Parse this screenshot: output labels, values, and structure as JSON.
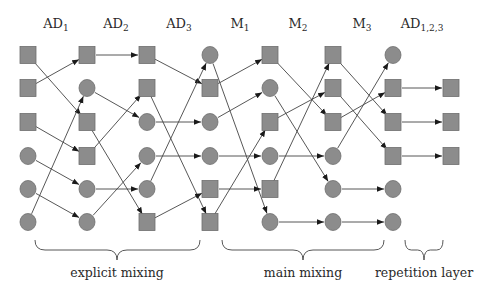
{
  "columns": [
    {
      "label": "AD",
      "sub": "1",
      "x": 28,
      "label_x": 56,
      "nodes": [
        "square",
        "square",
        "square",
        "circle",
        "circle",
        "circle"
      ]
    },
    {
      "label": "AD",
      "sub": "2",
      "x": 87,
      "label_x": 116,
      "nodes": [
        "square",
        "circle",
        "square",
        "square",
        "circle",
        "circle"
      ]
    },
    {
      "label": "AD",
      "sub": "3",
      "x": 147,
      "label_x": 179,
      "nodes": [
        "square",
        "square",
        "circle",
        "circle",
        "circle",
        "square"
      ]
    },
    {
      "label": "M",
      "sub": "1",
      "x": 210,
      "label_x": 240,
      "nodes": [
        "circle",
        "square",
        "circle",
        "circle",
        "square",
        "square"
      ]
    },
    {
      "label": "M",
      "sub": "2",
      "x": 270,
      "label_x": 298,
      "nodes": [
        "square",
        "circle",
        "square",
        "circle",
        "square",
        "circle"
      ]
    },
    {
      "label": "M",
      "sub": "3",
      "x": 333,
      "label_x": 362,
      "nodes": [
        "square",
        "square",
        "square",
        "circle",
        "circle",
        "circle"
      ]
    },
    {
      "label": "AD",
      "sub": "1,2,3",
      "x": 393,
      "label_x": 422,
      "nodes": [
        "circle",
        "square",
        "square",
        "square",
        "circle",
        "circle"
      ]
    },
    {
      "label": "",
      "sub": "",
      "x": 451,
      "label_x": null,
      "nodes": [
        null,
        "square",
        "square",
        "square",
        null,
        null
      ]
    }
  ],
  "row_y": [
    55,
    88,
    122,
    156,
    189,
    222
  ],
  "edges": [
    [
      [
        0,
        2
      ],
      [
        1,
        0
      ],
      [
        2,
        3
      ],
      [
        3,
        4
      ],
      [
        4,
        5
      ],
      [
        5,
        1
      ]
    ],
    [
      [
        0,
        0
      ],
      [
        1,
        2
      ],
      [
        2,
        5
      ],
      [
        3,
        1
      ],
      [
        4,
        4
      ],
      [
        5,
        3
      ]
    ],
    [
      [
        0,
        1
      ],
      [
        1,
        5
      ],
      [
        2,
        2
      ],
      [
        3,
        3
      ],
      [
        4,
        0
      ],
      [
        5,
        4
      ]
    ],
    [
      [
        0,
        5
      ],
      [
        1,
        0
      ],
      [
        2,
        1
      ],
      [
        3,
        3
      ],
      [
        4,
        4
      ],
      [
        5,
        2
      ]
    ],
    [
      [
        0,
        2
      ],
      [
        1,
        4
      ],
      [
        2,
        1
      ],
      [
        3,
        3
      ],
      [
        4,
        0
      ],
      [
        5,
        5
      ]
    ],
    [
      [
        0,
        2
      ],
      [
        1,
        3
      ],
      [
        2,
        1
      ],
      [
        3,
        0
      ],
      [
        4,
        4
      ],
      [
        5,
        5
      ]
    ],
    [
      [
        1,
        1
      ],
      [
        2,
        2
      ],
      [
        3,
        3
      ]
    ]
  ],
  "braces": [
    {
      "label": "explicit mixing",
      "x1": 35,
      "x2": 200,
      "tip": 117
    },
    {
      "label": "main mixing",
      "x1": 222,
      "x2": 384,
      "tip": 303
    },
    {
      "label": "repetition layer",
      "x1": 405,
      "x2": 443,
      "tip": 424
    }
  ],
  "colors": {
    "node_fill": "#8c8c8c",
    "node_stroke": "#6e6e6e",
    "edge": "#444444",
    "text": "#2a2a2a"
  }
}
